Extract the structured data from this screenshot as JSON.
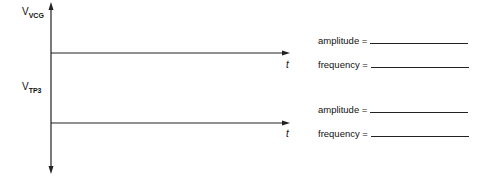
{
  "diagram": {
    "signal1": {
      "label_main": "V",
      "label_sub": "VCG",
      "time_axis": "t"
    },
    "signal2": {
      "label_main": "V",
      "label_sub": "TP3",
      "time_axis": "t"
    },
    "answers": [
      {
        "amplitude_label": "amplitude =",
        "amplitude_value": "",
        "frequency_label": "frequency =",
        "frequency_value": ""
      },
      {
        "amplitude_label": "amplitude =",
        "amplitude_value": "",
        "frequency_label": "frequency =",
        "frequency_value": ""
      }
    ]
  }
}
